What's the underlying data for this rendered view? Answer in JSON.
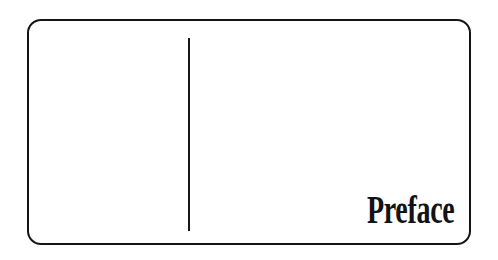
{
  "page": {
    "width": 498,
    "height": 260,
    "background_color": "#ffffff",
    "kind": "book-section-divider-page"
  },
  "frame": {
    "name": "rounded-rectangle-border",
    "stroke_color": "#14141a",
    "stroke_width": 2,
    "corner_radius": 14,
    "left": 27,
    "top": 19,
    "width": 444,
    "height": 226
  },
  "divider_rule": {
    "name": "vertical-rule",
    "orientation": "vertical",
    "color": "#16161c",
    "thickness": 2,
    "x": 188,
    "top": 38,
    "length": 193
  },
  "heading": {
    "text": "Preface",
    "color": "#121217",
    "align": "right",
    "position": "bottom-right",
    "font_style": "condensed display serif",
    "cap_height_px": 25
  }
}
